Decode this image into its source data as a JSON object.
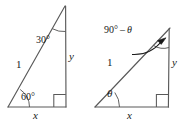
{
  "figure": {
    "stroke_color": "#595959",
    "text_color": "#1a1a1a",
    "background_color": "#ffffff",
    "triangles": [
      {
        "id": "left-triangle",
        "name": "thirty-sixty-ninety-triangle",
        "vertices": {
          "bottom_left": [
            8,
            107
          ],
          "bottom_right": [
            66,
            107
          ],
          "apex": [
            65,
            6
          ]
        },
        "labels": {
          "apex_angle": "30°",
          "hypotenuse": "1",
          "vertical_leg": "y",
          "base_angle": "60°",
          "base": "x"
        },
        "right_angle_marker": {
          "at": "bottom_right",
          "size": 12
        }
      },
      {
        "id": "right-triangle",
        "name": "theta-complement-triangle",
        "vertices": {
          "bottom_left": [
            95,
            107
          ],
          "bottom_right": [
            168,
            107
          ],
          "apex": [
            170,
            28
          ]
        },
        "labels": {
          "apex_angle_prefix": "90°",
          "apex_angle_minus": "–",
          "apex_angle_theta": "θ",
          "apex_angle": "90° – θ",
          "hypotenuse": "1",
          "vertical_leg": "y",
          "base_angle": "θ",
          "base": "x"
        },
        "right_angle_marker": {
          "at": "bottom_right",
          "size": 12
        },
        "leader_arrow": {
          "from": [
            140,
            55
          ],
          "to": [
            166,
            38
          ]
        }
      }
    ]
  }
}
